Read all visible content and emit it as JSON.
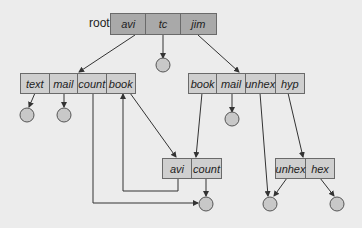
{
  "diagram": {
    "type": "acyclic-graph-directory",
    "root": {
      "label": "root",
      "entries": [
        "avi",
        "tc",
        "jim"
      ]
    },
    "directories": [
      {
        "id": "avi-dir",
        "entries": [
          "text",
          "mail",
          "count",
          "book"
        ]
      },
      {
        "id": "jim-dir",
        "entries": [
          "book",
          "mail",
          "unhex",
          "hyp"
        ]
      },
      {
        "id": "shared-dir",
        "entries": [
          "avi",
          "count"
        ]
      },
      {
        "id": "hyp-dir",
        "entries": [
          "unhex",
          "hex"
        ]
      }
    ],
    "edges": [
      {
        "from": "root.avi",
        "to": "avi-dir"
      },
      {
        "from": "root.tc",
        "to": "file"
      },
      {
        "from": "root.jim",
        "to": "jim-dir"
      },
      {
        "from": "avi-dir.text",
        "to": "file"
      },
      {
        "from": "avi-dir.mail",
        "to": "file"
      },
      {
        "from": "avi-dir.count",
        "to": "shared-count-file"
      },
      {
        "from": "avi-dir.book",
        "to": "shared-dir"
      },
      {
        "from": "jim-dir.book",
        "to": "shared-dir"
      },
      {
        "from": "jim-dir.mail",
        "to": "file"
      },
      {
        "from": "jim-dir.unhex",
        "to": "unhex-file"
      },
      {
        "from": "jim-dir.hyp",
        "to": "hyp-dir"
      },
      {
        "from": "shared-dir.avi",
        "to": "avi-dir"
      },
      {
        "from": "shared-dir.count",
        "to": "shared-count-file"
      },
      {
        "from": "hyp-dir.unhex",
        "to": "unhex-file"
      },
      {
        "from": "hyp-dir.hex",
        "to": "file"
      }
    ],
    "colors": {
      "background": "#ececec",
      "root_fill": "#a9a9a9",
      "dir_fill": "#cfcfcf",
      "file_fill": "#c8c8c8",
      "stroke": "#333333"
    }
  }
}
